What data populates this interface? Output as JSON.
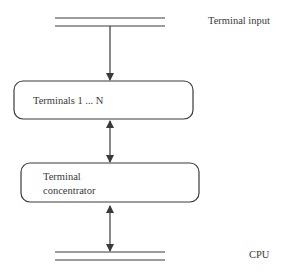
{
  "diagram": {
    "bus_top_label": "Terminal input",
    "bus_bottom_label": "CPU",
    "nodes": [
      {
        "id": "terminals",
        "lines": [
          "Terminals 1 ... N"
        ]
      },
      {
        "id": "concentrator",
        "lines": [
          "Terminal",
          "concentrator"
        ]
      }
    ],
    "edges": [
      {
        "from": "Terminal input",
        "to": "Terminals 1 ... N",
        "type": "single-arrow-down"
      },
      {
        "from": "Terminals 1 ... N",
        "to": "Terminal concentrator",
        "type": "double-arrow"
      },
      {
        "from": "Terminal concentrator",
        "to": "CPU",
        "type": "double-arrow"
      }
    ],
    "colors": {
      "stroke": "#3a3a3a",
      "background": "#ffffff"
    }
  }
}
